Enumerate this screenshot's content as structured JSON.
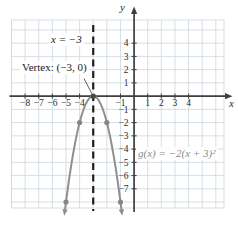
{
  "figure": {
    "bg": "#ffffff",
    "grid_color": "#ccd7de",
    "axis_color": "#3f3f3f",
    "tick_label_color": "#2b2b2b",
    "curve_color": "#8f8f8f",
    "point_color": "#868686",
    "vertex_dot_color": "#4a4a4a",
    "dash_color": "#1d1d1d",
    "formula_color": "#8a8a8a"
  },
  "annotations": {
    "asymptote_label": "x = −3",
    "vertex_label": "Vertex: (−3, 0)",
    "formula_label": "g(x) = −2(x + 3)²"
  },
  "chart_data": {
    "type": "line",
    "title": "",
    "subtitle": "Graph of a downward parabola with vertex (−3, 0) and axis of symmetry x = −3",
    "function_label": "g(x) = −2(x + 3)²",
    "parabola": {
      "a": -2,
      "h": -3,
      "k": 0
    },
    "vertex": [
      -3,
      0
    ],
    "axis_of_symmetry": -3,
    "axis_of_symmetry_label": "x = −3",
    "vertex_label": "Vertex: (−3, 0)",
    "points": [
      [
        -4,
        -2
      ],
      [
        -2,
        -2
      ],
      [
        -5,
        -8
      ],
      [
        -1,
        -8
      ]
    ],
    "curve_y_end": -8.55,
    "xlabel": "x",
    "ylabel": "y",
    "xlim": [
      -9,
      6.6
    ],
    "ylim": [
      -8.45,
      5.75
    ],
    "grid": true,
    "x_ticks": {
      "values": [
        -8,
        -7,
        -6,
        -5,
        -4,
        -1,
        1,
        2,
        3,
        4
      ],
      "labels": [
        "−8",
        "−7",
        "−6",
        "−5",
        "−4",
        "−1",
        "1",
        "2",
        "3",
        "4"
      ]
    },
    "y_ticks": {
      "values": [
        4,
        3,
        2,
        1,
        -1,
        -2,
        -3,
        -4,
        -5,
        -6,
        -7
      ],
      "labels": [
        "4",
        "3",
        "2",
        "1",
        "−1",
        "−2",
        "−3",
        "−4",
        "−5",
        "−6",
        "−7"
      ]
    }
  }
}
